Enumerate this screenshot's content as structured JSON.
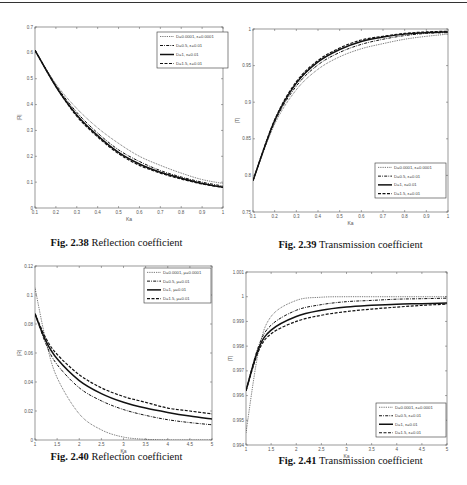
{
  "page": {
    "header_partial": "... ing ... ... 61"
  },
  "chart_data": [
    {
      "id": "fig-2-38",
      "type": "line",
      "caption_label": "Fig. 2.38",
      "caption_text": "Reflection coefficient",
      "xlabel": "Ka",
      "ylabel": "|R|",
      "xlim": [
        0.1,
        1
      ],
      "ylim": [
        0,
        0.7
      ],
      "xticks": [
        0.1,
        0.2,
        0.3,
        0.4,
        0.5,
        0.6,
        0.7,
        0.8,
        0.9,
        1
      ],
      "xtick_labels": [
        "0.1",
        "0.2",
        "0.3",
        "0.4",
        "0.5",
        "0.6",
        "0.7",
        "0.8",
        "0.9",
        "1"
      ],
      "yticks": [
        0,
        0.1,
        0.2,
        0.3,
        0.4,
        0.5,
        0.6,
        0.7
      ],
      "ytick_labels": [
        "0",
        "0.1",
        "0.2",
        "0.3",
        "0.4",
        "0.5",
        "0.6",
        "0.7"
      ],
      "grid": false,
      "legend_position": "upper right",
      "x": [
        0.1,
        0.2,
        0.3,
        0.4,
        0.5,
        0.6,
        0.7,
        0.8,
        0.9,
        1.0
      ],
      "series": [
        {
          "name": "D=0.0001, ε=0.0001",
          "style": "dotted",
          "values": [
            0.61,
            0.48,
            0.385,
            0.31,
            0.25,
            0.2,
            0.165,
            0.135,
            0.11,
            0.095
          ]
        },
        {
          "name": "D=0.5, ε=0.01",
          "style": "dashdot",
          "values": [
            0.61,
            0.475,
            0.37,
            0.29,
            0.225,
            0.18,
            0.145,
            0.12,
            0.1,
            0.085
          ]
        },
        {
          "name": "D=1, ε=0.01",
          "style": "solid",
          "values": [
            0.61,
            0.47,
            0.36,
            0.28,
            0.215,
            0.17,
            0.138,
            0.115,
            0.095,
            0.08
          ]
        },
        {
          "name": "D=1.5, ε=0.01",
          "style": "dashed",
          "values": [
            0.61,
            0.47,
            0.355,
            0.275,
            0.21,
            0.165,
            0.135,
            0.112,
            0.093,
            0.08
          ]
        }
      ]
    },
    {
      "id": "fig-2-39",
      "type": "line",
      "caption_label": "Fig. 2.39",
      "caption_text": "Transmission coefficient",
      "xlabel": "Ka",
      "ylabel": "|T|",
      "xlim": [
        0.1,
        1
      ],
      "ylim": [
        0.75,
        1
      ],
      "xticks": [
        0.1,
        0.2,
        0.3,
        0.4,
        0.5,
        0.6,
        0.7,
        0.8,
        0.9,
        1
      ],
      "xtick_labels": [
        "0.1",
        "0.2",
        "0.3",
        "0.4",
        "0.5",
        "0.6",
        "0.7",
        "0.8",
        "0.9",
        "1"
      ],
      "yticks": [
        0.75,
        0.8,
        0.85,
        0.9,
        0.95,
        1
      ],
      "ytick_labels": [
        "0.75",
        "0.8",
        "0.85",
        "0.9",
        "0.95",
        "1"
      ],
      "grid": false,
      "legend_position": "lower right",
      "x": [
        0.1,
        0.2,
        0.3,
        0.4,
        0.5,
        0.6,
        0.7,
        0.8,
        0.9,
        1.0
      ],
      "series": [
        {
          "name": "D=0.0001, ε=0.0001",
          "style": "dotted",
          "values": [
            0.793,
            0.87,
            0.917,
            0.945,
            0.962,
            0.973,
            0.98,
            0.986,
            0.99,
            0.993
          ]
        },
        {
          "name": "D=0.5, ε=0.01",
          "style": "dashdot",
          "values": [
            0.793,
            0.873,
            0.922,
            0.951,
            0.968,
            0.979,
            0.986,
            0.991,
            0.994,
            0.995
          ]
        },
        {
          "name": "D=1, ε=0.01",
          "style": "solid",
          "values": [
            0.793,
            0.875,
            0.926,
            0.955,
            0.972,
            0.983,
            0.989,
            0.993,
            0.995,
            0.996
          ]
        },
        {
          "name": "D=1.5, ε=0.01",
          "style": "dashed",
          "values": [
            0.793,
            0.876,
            0.928,
            0.957,
            0.974,
            0.985,
            0.99,
            0.994,
            0.996,
            0.997
          ]
        }
      ]
    },
    {
      "id": "fig-2-40",
      "type": "line",
      "caption_label": "Fig. 2.40",
      "caption_text": "Reflection coefficient",
      "xlabel": "Ka",
      "ylabel": "|R|",
      "xlim": [
        1,
        5
      ],
      "ylim": [
        0,
        0.12
      ],
      "xticks": [
        1,
        1.5,
        2,
        2.5,
        3,
        3.5,
        4,
        4.5,
        5
      ],
      "xtick_labels": [
        "1",
        "1.5",
        "2",
        "2.5",
        "3",
        "3.5",
        "4",
        "4.5",
        "5"
      ],
      "yticks": [
        0,
        0.02,
        0.04,
        0.06,
        0.08,
        0.1,
        0.12
      ],
      "ytick_labels": [
        "0",
        "0.02",
        "0.04",
        "0.06",
        "0.08",
        "0.1",
        "0.12"
      ],
      "grid": false,
      "legend_position": "upper right",
      "x": [
        1,
        1.25,
        1.5,
        2,
        2.5,
        3,
        3.5,
        4,
        4.5,
        5
      ],
      "series": [
        {
          "name": "D=0.0001, μ=0.0001",
          "style": "dotted",
          "values": [
            0.105,
            0.068,
            0.043,
            0.018,
            0.007,
            0.002,
            0.0005,
            0.0,
            0.0,
            0.0
          ]
        },
        {
          "name": "D=0.5, μ=0.01",
          "style": "dashdot",
          "values": [
            0.087,
            0.066,
            0.052,
            0.036,
            0.027,
            0.021,
            0.017,
            0.014,
            0.012,
            0.0105
          ]
        },
        {
          "name": "D=1, μ=0.01",
          "style": "solid",
          "values": [
            0.087,
            0.068,
            0.056,
            0.041,
            0.032,
            0.026,
            0.022,
            0.019,
            0.0165,
            0.0145
          ]
        },
        {
          "name": "D=1.5, μ=0.01",
          "style": "dashed",
          "values": [
            0.087,
            0.07,
            0.059,
            0.045,
            0.036,
            0.03,
            0.026,
            0.022,
            0.02,
            0.018
          ]
        }
      ]
    },
    {
      "id": "fig-2-41",
      "type": "line",
      "caption_label": "Fig. 2.41",
      "caption_text": "Transmission coefficient",
      "xlabel": "Ka",
      "ylabel": "|T|",
      "xlim": [
        1,
        5
      ],
      "ylim": [
        0.994,
        1.001
      ],
      "xticks": [
        1,
        1.5,
        2,
        2.5,
        3,
        3.5,
        4,
        4.5,
        5
      ],
      "xtick_labels": [
        "1",
        "1.5",
        "2",
        "2.5",
        "3",
        "3.5",
        "4",
        "4.5",
        "5"
      ],
      "yticks": [
        0.994,
        0.995,
        0.996,
        0.997,
        0.998,
        0.999,
        1,
        1.001
      ],
      "ytick_labels": [
        "0.994",
        "0.995",
        "0.996",
        "0.997",
        "0.998",
        "0.999",
        "1",
        "1.001"
      ],
      "grid": false,
      "legend_position": "lower right",
      "x": [
        1,
        1.25,
        1.5,
        2,
        2.5,
        3,
        3.5,
        4,
        4.5,
        5
      ],
      "series": [
        {
          "name": "D=0.0001, ε=0.0001",
          "style": "dotted",
          "values": [
            0.9945,
            0.9978,
            0.9992,
            0.99985,
            0.99998,
            1.0,
            1.0,
            1.0,
            1.0,
            1.0
          ]
        },
        {
          "name": "D=0.5, ε=0.01",
          "style": "dashdot",
          "values": [
            0.9962,
            0.998,
            0.99885,
            0.99945,
            0.99968,
            0.9998,
            0.99985,
            0.9999,
            0.99992,
            0.99994
          ]
        },
        {
          "name": "D=1, ε=0.01",
          "style": "solid",
          "values": [
            0.9962,
            0.9979,
            0.99865,
            0.9992,
            0.99945,
            0.99958,
            0.99965,
            0.9997,
            0.99972,
            0.99975
          ]
        },
        {
          "name": "D=1.5, ε=0.01",
          "style": "dashed",
          "values": [
            0.9962,
            0.9978,
            0.9985,
            0.999,
            0.99925,
            0.9994,
            0.9995,
            0.99958,
            0.99965,
            0.9997
          ]
        }
      ]
    }
  ]
}
